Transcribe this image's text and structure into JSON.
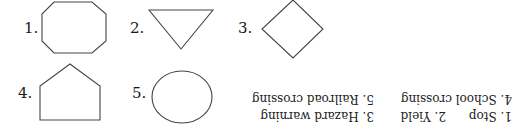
{
  "shapes": [
    {
      "number": "1.",
      "shape": "octagon"
    },
    {
      "number": "2.",
      "shape": "inverted-triangle"
    },
    {
      "number": "3.",
      "shape": "diamond"
    },
    {
      "number": "4.",
      "shape": "pentagon"
    },
    {
      "number": "5.",
      "shape": "circle"
    }
  ],
  "answer_key": {
    "orientation": "upside-down",
    "row1": [
      "1. Stop",
      "2. Yield",
      "3. Hazard warning"
    ],
    "row2": [
      "4. School crossing",
      "5. Railroad crossing"
    ]
  }
}
